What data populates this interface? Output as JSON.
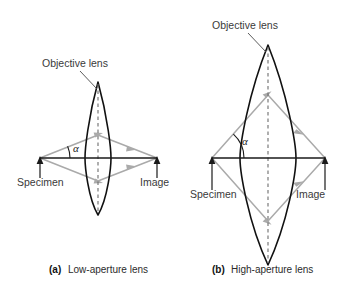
{
  "figure": {
    "background_color": "#ffffff",
    "ray_color": "#aaaaaa",
    "lens_color": "#111111",
    "axis_color": "#1a1a1a",
    "label_color": "#3a3a3a"
  },
  "panel_a": {
    "tag": "(a)",
    "caption": "Low-aperture lens",
    "lens_label": "Objective lens",
    "specimen_label": "Specimen",
    "image_label": "Image",
    "angle_label": "α",
    "aperture": "low",
    "half_angle_degrees": 22
  },
  "panel_b": {
    "tag": "(b)",
    "caption": "High-aperture lens",
    "lens_label": "Objective lens",
    "specimen_label": "Specimen",
    "image_label": "Image",
    "angle_label": "α",
    "aperture": "high",
    "half_angle_degrees": 48
  },
  "icons": {
    "up_arrow": "pointer-arrow-up-icon",
    "ray_arrow": "ray-arrowhead-icon",
    "leader": "leader-line-icon",
    "dashed_axis": "optical-axis-dashed-icon"
  }
}
